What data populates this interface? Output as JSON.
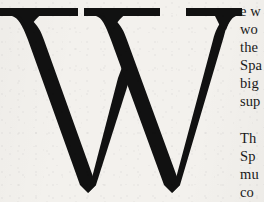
{
  "page": {
    "kind": "scanned-book-page-crop",
    "background_color": "#f3f1ed",
    "ink_color": "#111111",
    "width": 264,
    "height": 202
  },
  "dropcap": {
    "letter": "W",
    "style": "serif-display-black",
    "color": "#111111"
  },
  "body": {
    "paragraphs": [
      {
        "id": "paragraph-1",
        "lines": [
          "e w",
          "wo",
          "the",
          "Spa",
          "big",
          "sup"
        ]
      },
      {
        "id": "paragraph-2",
        "lines": [
          "Th",
          "Sp",
          "mu",
          "co"
        ]
      }
    ]
  }
}
